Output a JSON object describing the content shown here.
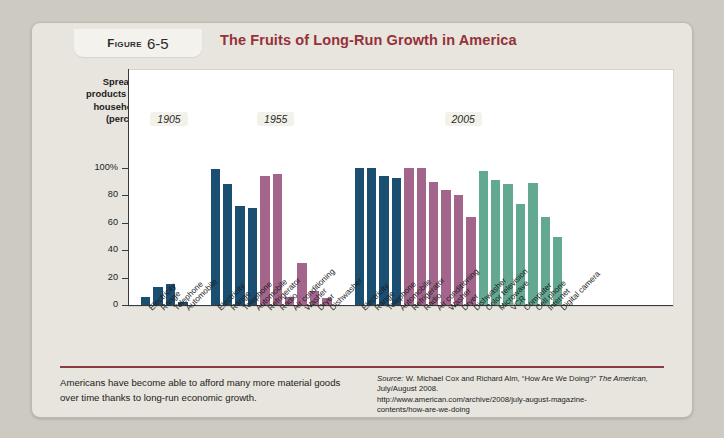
{
  "figure": {
    "tab_prefix": "Figure",
    "tab_number": "6-5",
    "title": "The Fruits of Long-Run Growth in America"
  },
  "footer": {
    "caption": "Americans have become able to afford many more material goods over time thanks to long-run economic growth.",
    "source_label": "Source:",
    "source_line1": " W. Michael Cox and Richard Alm, “How Are We Doing?” ",
    "source_italic": "The American,",
    "source_line2": " July/August 2008.",
    "source_url_line1": "http://www.american.com/archive/2008/july-august-magazine-",
    "source_url_line2": "contents/how-are-we-doing"
  },
  "colors": {
    "blue": "#1b4f72",
    "purple": "#a4658c",
    "green": "#63a891",
    "accent_red": "#96303a",
    "card_bg": "#e7e5dd",
    "plot_bg": "#ffffff"
  },
  "chart_data": {
    "type": "bar",
    "title": "The Fruits of Long-Run Growth in America",
    "ylabel": "Spread of products into households (percent)",
    "xlabel": "",
    "ylim": [
      0,
      100
    ],
    "yticks": [
      0,
      20,
      40,
      60,
      80,
      100
    ],
    "ytick_labels": [
      "0",
      "20",
      "40",
      "60",
      "80",
      "100%"
    ],
    "grid": false,
    "legend": "none",
    "group_labels": [
      "1905",
      "1955",
      "2005"
    ],
    "groups": [
      {
        "label": "1905",
        "categories": [
          "Electricity",
          "Range",
          "Telephone",
          "Automobile"
        ],
        "values": [
          6,
          13,
          15,
          2
        ],
        "colors": [
          "blue",
          "blue",
          "blue",
          "blue"
        ]
      },
      {
        "label": "1955",
        "categories": [
          "Electricity",
          "Range",
          "Telephone",
          "Automobile",
          "Refrigerator",
          "Radio",
          "Air conditioning",
          "Washer",
          "Dryer",
          "Dishwasher"
        ],
        "values": [
          99,
          88,
          72,
          71,
          94,
          96,
          6,
          31,
          10,
          5
        ],
        "colors": [
          "blue",
          "blue",
          "blue",
          "blue",
          "purple",
          "purple",
          "purple",
          "purple",
          "purple",
          "purple"
        ]
      },
      {
        "label": "2005",
        "categories": [
          "Electricity",
          "Range",
          "Telephone",
          "Automobile",
          "Refrigerator",
          "Radio",
          "Air conditioning",
          "Washer",
          "Dryer",
          "Dishwasher",
          "Color television",
          "Microwave",
          "VCR",
          "Computer",
          "Cell phone",
          "Internet",
          "Digital camera"
        ],
        "values": [
          100,
          100,
          94,
          93,
          100,
          100,
          90,
          84,
          80,
          64,
          98,
          91,
          88,
          74,
          89,
          64,
          50
        ],
        "colors": [
          "blue",
          "blue",
          "blue",
          "blue",
          "purple",
          "purple",
          "purple",
          "purple",
          "purple",
          "purple",
          "green",
          "green",
          "green",
          "green",
          "green",
          "green",
          "green"
        ]
      }
    ]
  }
}
